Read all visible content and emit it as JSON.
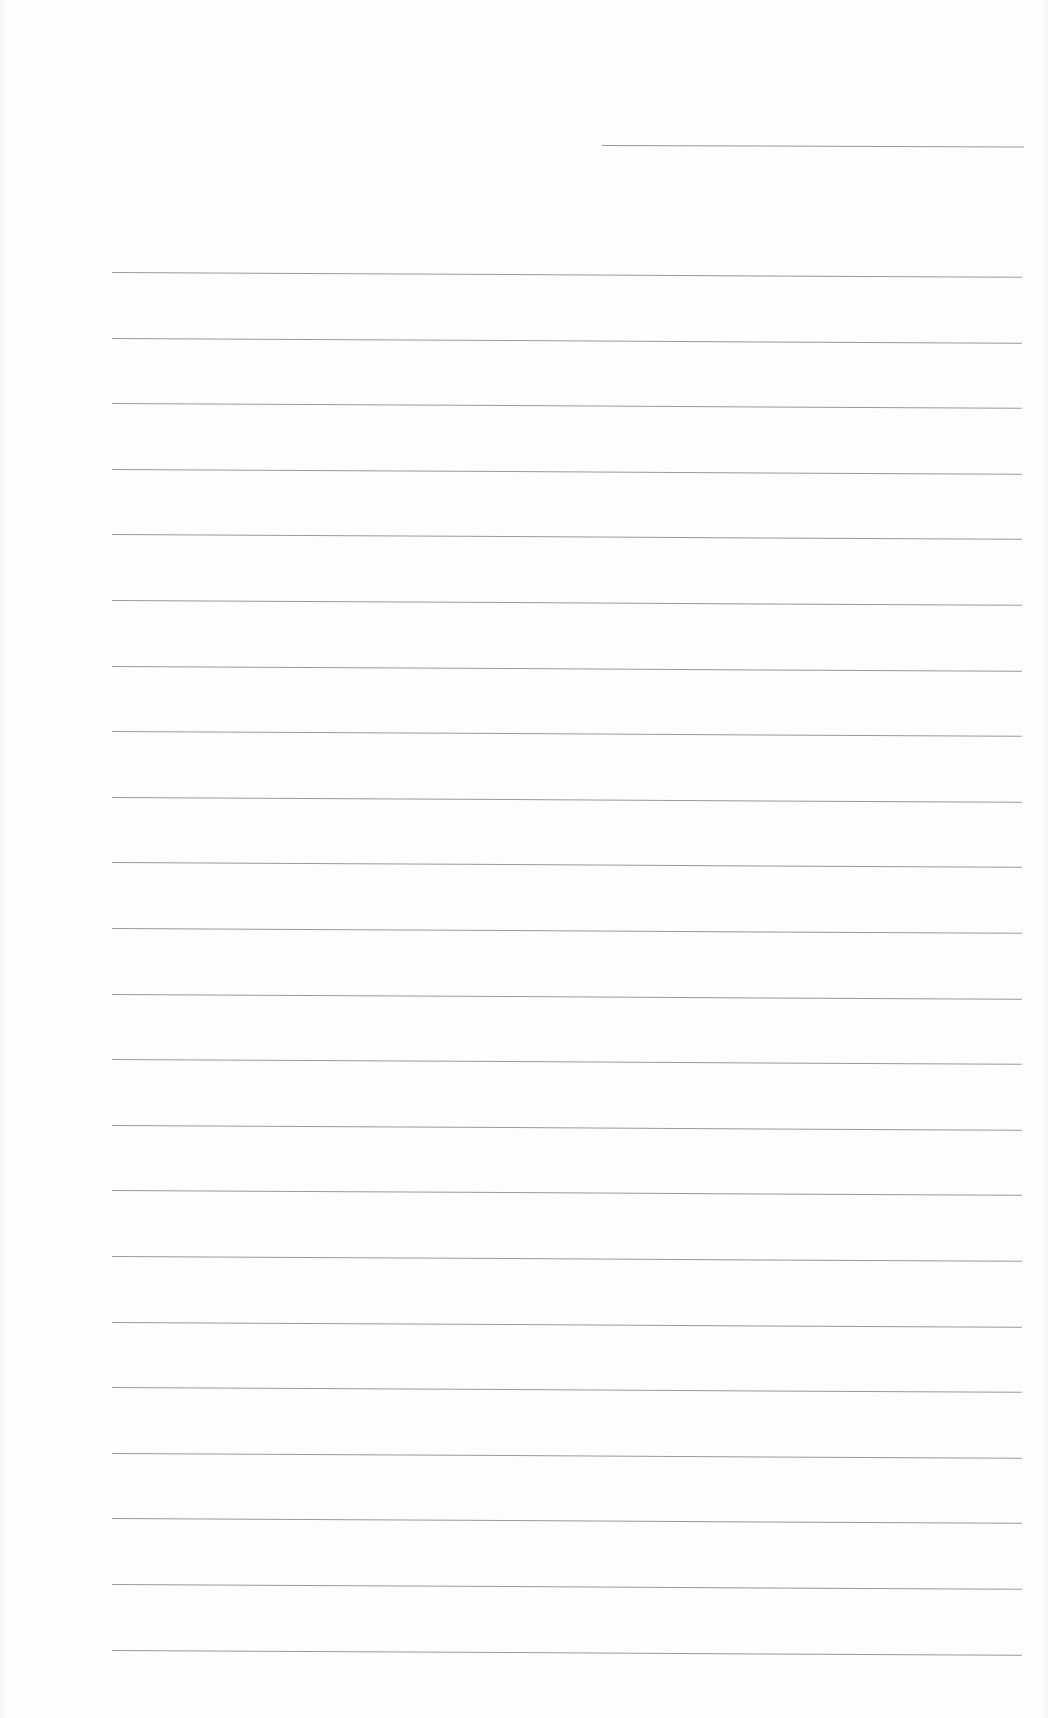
{
  "document": {
    "type": "lined-paper",
    "background_color": "#fdfdfd",
    "line_color": "#9a9a9a",
    "header_line": {
      "x_start": 602,
      "x_end": 1024,
      "y": 145,
      "tilt_deg": 0.2
    },
    "ruled_lines": {
      "count": 22,
      "x_start": 112,
      "x_end": 1022,
      "first_y": 272,
      "spacing": 65.6,
      "tilt_deg": 0.3
    },
    "text_content": []
  }
}
